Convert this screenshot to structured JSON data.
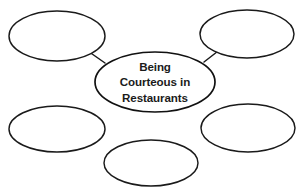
{
  "document": {
    "type": "graphic-organizer",
    "layout": "concept-web",
    "background_color": "#ffffff",
    "outline_color": "#1a1a1a",
    "text_color": "#1b1b1b",
    "partial_top_text": "Name: Date:"
  },
  "center_node": {
    "label_lines": [
      "Being",
      "Courteous in",
      "Restaurants"
    ],
    "line1": "Being",
    "line2": "Courteous in",
    "line3": "Restaurants",
    "full_text": "Being Courteous in Restaurants",
    "fill": "#ffffff",
    "stroke": "#111111"
  },
  "branch_nodes": [
    {
      "id": "top-left",
      "label": "",
      "cx": 57,
      "cy": 36,
      "rx": 48,
      "ry": 25
    },
    {
      "id": "top-right",
      "label": "",
      "cx": 247,
      "cy": 34,
      "rx": 47,
      "ry": 24
    },
    {
      "id": "bottom-left",
      "label": "",
      "cx": 57,
      "cy": 129,
      "rx": 48,
      "ry": 23
    },
    {
      "id": "bottom-right",
      "label": "",
      "cx": 248,
      "cy": 128,
      "rx": 47,
      "ry": 24
    },
    {
      "id": "bottom-center",
      "label": "",
      "cx": 151,
      "cy": 163,
      "rx": 47,
      "ry": 23
    }
  ],
  "connectors": [
    {
      "id": "center-to-top-left",
      "x1": 105,
      "y1": 63,
      "x2": 85,
      "y2": 49
    },
    {
      "id": "center-to-top-right",
      "x1": 204,
      "y1": 62,
      "x2": 222,
      "y2": 48
    }
  ]
}
